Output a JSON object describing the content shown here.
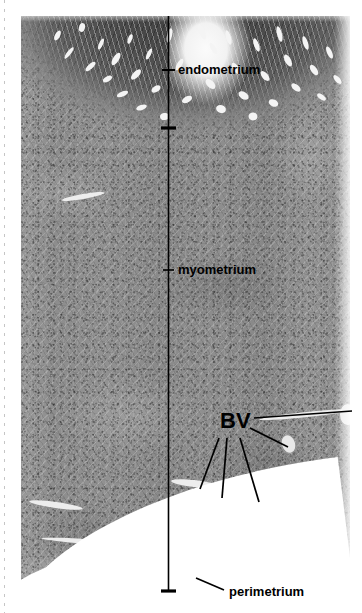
{
  "figure": {
    "specimen": "uterine wall cross-section",
    "stain": "grayscale light micrograph",
    "canvas": {
      "width": 362,
      "height": 613,
      "background": "#ffffff"
    },
    "micrograph": {
      "x": 21,
      "y": 16,
      "width": 329,
      "height": 588
    }
  },
  "annotations": {
    "colors": {
      "line": "#000000",
      "text": "#000000",
      "tissue_light": "#8f8f8f",
      "tissue_dark": "#4c4c4c",
      "lumen": "#f4f4f4"
    },
    "scale_bar": {
      "name": "layer-depth-line",
      "x": 168,
      "y_top": 16,
      "y_bottom": 591,
      "ticks": [
        {
          "label": "endometrium-tick",
          "y": 70,
          "x1": 162,
          "x2": 175,
          "thickness": 2
        },
        {
          "label": "endometrium-myometrium-boundary-tick",
          "y": 128,
          "x1": 161,
          "x2": 176,
          "thickness": 3
        },
        {
          "label": "perimetrium-tick",
          "y": 591,
          "x1": 161,
          "x2": 176,
          "thickness": 3
        }
      ]
    },
    "labels": [
      {
        "id": "endometrium",
        "text": "endometrium",
        "x": 178,
        "y": 64,
        "size": "label-sm"
      },
      {
        "id": "myometrium",
        "text": "myometrium",
        "x": 178,
        "y": 264,
        "size": "label-sm"
      },
      {
        "id": "bv",
        "text": "BV",
        "x": 221,
        "y": 410,
        "size": "label-bv"
      },
      {
        "id": "perimetrium",
        "text": "perimetrium",
        "x": 228,
        "y": 586,
        "size": "label-sm"
      }
    ],
    "leader_lines": [
      {
        "id": "bv-leader-right-far",
        "x1": 254,
        "y1": 418,
        "x2": 352,
        "y2": 411
      },
      {
        "id": "bv-leader-right-near",
        "x1": 250,
        "y1": 427,
        "x2": 288,
        "y2": 446
      },
      {
        "id": "bv-leader-lower-left",
        "x1": 219,
        "y1": 438,
        "x2": 200,
        "y2": 487
      },
      {
        "id": "bv-leader-lower-mid",
        "x1": 226,
        "y1": 438,
        "x2": 222,
        "y2": 496
      },
      {
        "id": "bv-leader-lower-right",
        "x1": 239,
        "y1": 438,
        "x2": 258,
        "y2": 500
      },
      {
        "id": "perimetrium-leader",
        "x1": 224,
        "y1": 589,
        "x2": 196,
        "y2": 578
      }
    ],
    "structures": [
      {
        "id": "endometrium-layer",
        "note": "dark glandular mucosa, top band with bright gland lumina"
      },
      {
        "id": "myometrium-layer",
        "note": "thick pale smooth-muscle wall, bulk of the section"
      },
      {
        "id": "perimetrium-layer",
        "note": "thin outer serosal edge along the curved bottom border"
      },
      {
        "id": "blood-vessels",
        "note": "BV — five large vessels in the outer myometrium"
      }
    ]
  }
}
